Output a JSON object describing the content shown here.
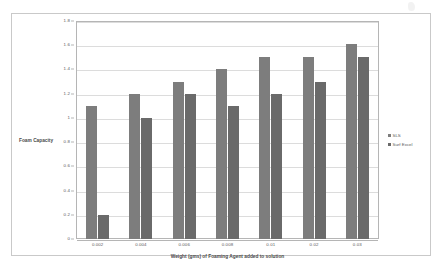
{
  "document": {
    "background_color": "#ffffff",
    "border_color": "#c9c9c9"
  },
  "chart_data": {
    "type": "bar",
    "title": "",
    "subtitle": "",
    "xlabel": "Weight (gms) of Foaming Agent added to solution",
    "ylabel": "Foam Capacity",
    "categories": [
      "0.002",
      "0.004",
      "0.006",
      "0.008",
      "0.01",
      "0.02",
      "0.03"
    ],
    "series": [
      {
        "name": "SLS",
        "color": "#7d7d7d",
        "values": [
          1.1,
          1.2,
          1.3,
          1.4,
          1.5,
          1.5,
          1.61
        ]
      },
      {
        "name": "Surf Excel",
        "color": "#6a6a6a",
        "values": [
          0.2,
          1.0,
          1.2,
          1.1,
          1.2,
          1.3,
          1.5
        ]
      }
    ],
    "ylim": [
      0,
      1.8
    ],
    "ytick_labels": [
      "0",
      "0.2",
      "0.4",
      "0.6",
      "0.8",
      "1",
      "1.2",
      "1.4",
      "1.6",
      "1.8"
    ],
    "ytick_values": [
      0,
      0.2,
      0.4,
      0.6,
      0.8,
      1,
      1.2,
      1.4,
      1.6,
      1.8
    ],
    "grid": true,
    "grid_axis": "y",
    "legend_position": "right",
    "plot_border_color": "#b5b5b5",
    "gridline_color": "#dcdcdc"
  }
}
